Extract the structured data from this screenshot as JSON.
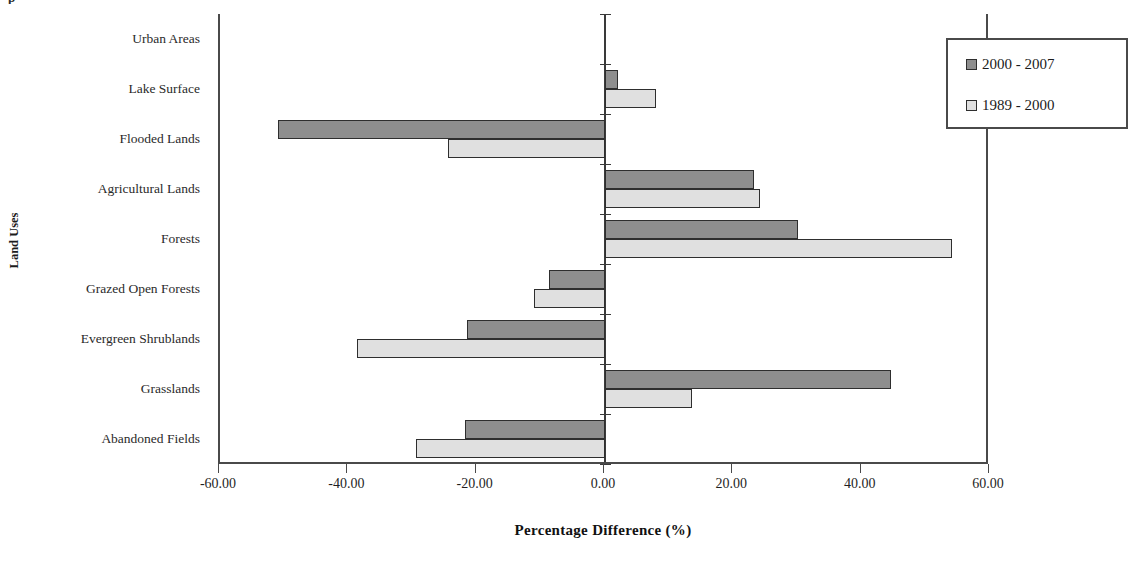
{
  "clipped_title": "p",
  "axes": {
    "ylabel": "Land Uses",
    "xlabel": "Percentage Difference (%)"
  },
  "legend": {
    "items": [
      {
        "label": "2000 - 2007",
        "color": "#8e8e8e"
      },
      {
        "label": "1989 - 2000",
        "color": "#e0e0e0"
      }
    ]
  },
  "chart_data": {
    "type": "bar",
    "orientation": "horizontal",
    "title": "",
    "xlabel": "Percentage Difference (%)",
    "ylabel": "Land Uses",
    "xlim": [
      -60,
      60
    ],
    "xticks": [
      -60,
      -40,
      -20,
      0,
      20,
      40,
      60
    ],
    "xticklabels": [
      "-60.00",
      "-40.00",
      "-20.00",
      "0.00",
      "20.00",
      "40.00",
      "60.00"
    ],
    "grid": false,
    "legend_position": "upper right",
    "categories": [
      "Urban Areas",
      "Lake Surface",
      "Flooded Lands",
      "Agricultural Lands",
      "Forests",
      "Grazed Open Forests",
      "Evergreen Shrublands",
      "Grasslands",
      "Abandoned Fields"
    ],
    "series": [
      {
        "name": "2000 - 2007",
        "color": "#8e8e8e",
        "values": [
          0.0,
          2.0,
          -50.9,
          23.2,
          30.0,
          -8.7,
          -21.5,
          44.5,
          -21.8
        ]
      },
      {
        "name": "1989 - 2000",
        "color": "#e0e0e0",
        "values": [
          0.0,
          8.0,
          -24.5,
          24.2,
          54.0,
          -11.0,
          -38.7,
          13.5,
          -29.5
        ]
      }
    ]
  }
}
